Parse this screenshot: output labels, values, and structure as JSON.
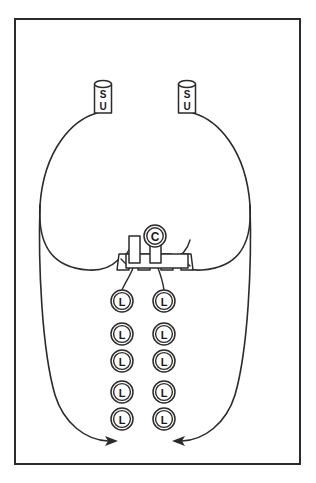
{
  "figure": {
    "width": 316,
    "height": 483,
    "background_color": "#ffffff",
    "stroke_color": "#2b2b2b"
  },
  "frame": {
    "name": "outer-border",
    "x": 15,
    "y": 19,
    "width": 285,
    "height": 445
  },
  "subunits": [
    {
      "id": "su-left",
      "label_top": "S",
      "label_bottom": "U",
      "shape": "cylinder",
      "cx": 103,
      "top_y": 81,
      "bottom_y": 113,
      "width": 17
    },
    {
      "id": "su-right",
      "label_top": "S",
      "label_bottom": "U",
      "shape": "cylinder",
      "cx": 187,
      "top_y": 81,
      "bottom_y": 113,
      "width": 17
    }
  ],
  "core": {
    "id": "c-node",
    "label": "C",
    "cx": 155,
    "cy": 236,
    "r": 11
  },
  "posts": [
    {
      "id": "post-left",
      "x": 129,
      "y": 236,
      "width": 11,
      "height": 26
    },
    {
      "id": "post-right",
      "x": 150,
      "y": 236,
      "width": 11,
      "height": 26
    }
  ],
  "platform": {
    "id": "membrane-platform",
    "x": 118,
    "y": 254,
    "width": 74,
    "height": 14
  },
  "wedges": [
    {
      "id": "wedge-outer-left"
    },
    {
      "id": "wedge-inner-left"
    },
    {
      "id": "wedge-inner-right"
    },
    {
      "id": "wedge-outer-right"
    }
  ],
  "chains": [
    {
      "id": "chain-left",
      "cx": 122,
      "node_label": "L",
      "node_radius": 11,
      "node_count": 5,
      "node_y": [
        301,
        334,
        361,
        392,
        419
      ]
    },
    {
      "id": "chain-right",
      "cx": 164,
      "node_label": "L",
      "node_radius": 11,
      "node_count": 5,
      "node_y": [
        301,
        334,
        361,
        392,
        419
      ]
    }
  ],
  "loops": [
    {
      "id": "loop-left",
      "description": "Large left loop from SU-left down around to arrowhead",
      "arrow_direction": "right-down",
      "arrow_x": 113,
      "arrow_y": 440
    },
    {
      "id": "loop-right",
      "description": "Large right loop from SU-right down around to arrowhead",
      "arrow_direction": "left-down",
      "arrow_x": 197,
      "arrow_y": 440
    }
  ],
  "stems": [
    {
      "id": "stem-left",
      "from_x": 133,
      "from_y": 268,
      "to_x": 122,
      "to_y": 290
    },
    {
      "id": "stem-right",
      "from_x": 158,
      "from_y": 268,
      "to_x": 164,
      "to_y": 290
    }
  ]
}
